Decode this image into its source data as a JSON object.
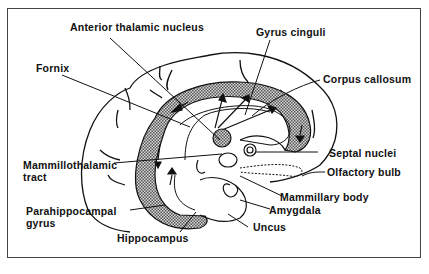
{
  "figure": {
    "labels": {
      "anterior_thalamic_nucleus": "Anterior thalamic nucleus",
      "gyrus_cinguli": "Gyrus cinguli",
      "fornix": "Fornix",
      "corpus_callosum": "Corpus callosum",
      "mammillothalamic_tract_1": "Mammillothalamic",
      "mammillothalamic_tract_2": "tract",
      "septal_nuclei": "Septal nuclei",
      "olfactory_bulb": "Olfactory bulb",
      "mammillary_body": "Mammillary body",
      "parahippocampal_gyrus_1": "Parahippocampal",
      "parahippocampal_gyrus_2": "gyrus",
      "amygdala": "Amygdala",
      "uncus": "Uncus",
      "hippocampus": "Hippocampus"
    },
    "colors": {
      "line": "#111111",
      "shading": "#9a9a9a",
      "frame": "#444444",
      "background": "#ffffff"
    }
  }
}
